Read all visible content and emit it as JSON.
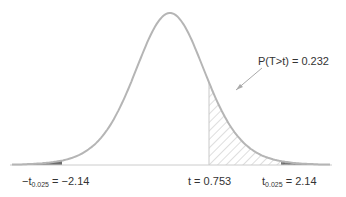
{
  "diagram": {
    "type": "t-distribution two-tailed test",
    "curve_color": "#b5b5b5",
    "tail_fill_color": "#6e6e6e",
    "hatch_color": "#bdbdbd",
    "baseline_color": "#cccccc"
  },
  "labels": {
    "p_value": "P(T>t) = 0.232",
    "t_stat": "t = 0.753",
    "left_critical_prefix": "−t",
    "left_critical_sub": "0.025",
    "left_critical_value": " = −2.14",
    "right_critical_prefix": "t",
    "right_critical_sub": "0.025",
    "right_critical_value": " = 2.14"
  },
  "chart_data": {
    "type": "area",
    "title": "",
    "distribution": "Student's t",
    "annotations": [
      {
        "label": "P(T>t) = 0.232",
        "region": "right of t = 0.753",
        "style": "hatched"
      },
      {
        "label": "-t_0.025 = -2.14",
        "region": "left tail",
        "style": "dark fill"
      },
      {
        "label": "t_0.025 = 2.14",
        "region": "right tail",
        "style": "dark fill"
      }
    ],
    "x_markers": [
      -2.14,
      0.753,
      2.14
    ],
    "t_statistic": 0.753,
    "critical_value": 2.14,
    "alpha_per_tail": 0.025,
    "p_value_one_tail": 0.232
  }
}
